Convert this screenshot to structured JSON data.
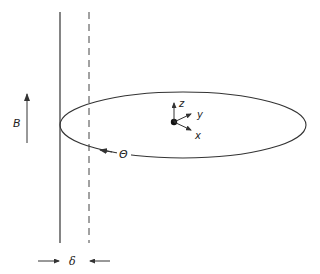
{
  "diagram": {
    "labels": {
      "magnetic_field": "B",
      "angle": "Θ",
      "gap": "δ",
      "axis_x": "x",
      "axis_y": "y",
      "axis_z": "z"
    },
    "colors": {
      "stroke": "#333333",
      "background": "#ffffff"
    }
  }
}
